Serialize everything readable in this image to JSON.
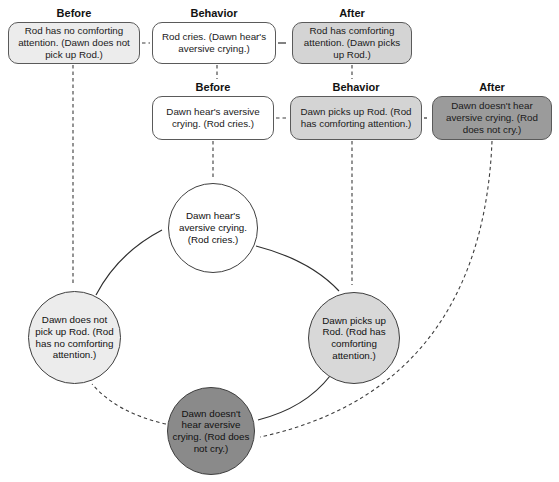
{
  "diagram_type": "behavior-contingency-cycle",
  "colors": {
    "background": "#ffffff",
    "box_white": "#ffffff",
    "box_light_gray": "#ececec",
    "box_medium_gray": "#d4d4d4",
    "box_dark_gray": "#9b9b9b",
    "circle_dark_gray": "#8a8a8a",
    "outline": "#5a5a5a",
    "arrow": "#2e2e2e"
  },
  "rows": [
    {
      "cells": [
        {
          "label": "Before",
          "text": "Rod has no comforting attention. (Dawn does not pick up Rod.)",
          "tone": "light"
        },
        {
          "label": "Behavior",
          "text": "Rod cries. (Dawn hear's aversive crying.)",
          "tone": "white"
        },
        {
          "label": "After",
          "text": "Rod has comforting attention. (Dawn picks up Rod.)",
          "tone": "mid"
        }
      ]
    },
    {
      "cells": [
        {
          "label": "Before",
          "text": "Dawn hear's aversive crying. (Rod cries.)",
          "tone": "white"
        },
        {
          "label": "Behavior",
          "text": "Dawn picks up Rod. (Rod has comforting attention.)",
          "tone": "mid"
        },
        {
          "label": "After",
          "text": "Dawn doesn't hear aversive crying. (Rod does not cry.)",
          "tone": "dark"
        }
      ]
    }
  ],
  "circles": [
    {
      "id": "aversive-crying",
      "text": "Dawn hear's aversive crying. (Rod cries.)",
      "tone": "white"
    },
    {
      "id": "no-pickup",
      "text": "Dawn does not pick up Rod. (Rod has no comforting attention.)",
      "tone": "light"
    },
    {
      "id": "pickup",
      "text": "Dawn picks up Rod. (Rod has comforting attention.)",
      "tone": "mid"
    },
    {
      "id": "no-crying",
      "text": "Dawn doesn't hear aversive crying. (Rod does not cry.)",
      "tone": "dark"
    }
  ],
  "connections": [
    {
      "from": "row1-before",
      "to": "row1-behavior",
      "style": "dashed"
    },
    {
      "from": "row1-behavior",
      "to": "row1-after",
      "style": "solid-arrow"
    },
    {
      "from": "row2-before",
      "to": "row2-behavior",
      "style": "dashed"
    },
    {
      "from": "row2-behavior",
      "to": "row2-after",
      "style": "solid-arrow"
    },
    {
      "from": "row1-before",
      "to": "circle-no-pickup",
      "style": "dashed-arrow"
    },
    {
      "from": "row1-behavior",
      "to": "row2-before",
      "style": "dashed"
    },
    {
      "from": "row1-after",
      "to": "row2-behavior",
      "style": "dashed"
    },
    {
      "from": "row2-before",
      "to": "circle-aversive-crying",
      "style": "dashed-arrow"
    },
    {
      "from": "row2-behavior",
      "to": "circle-pickup",
      "style": "dashed-arrow"
    },
    {
      "from": "row2-after",
      "to": "circle-no-crying",
      "style": "dashed-arrow"
    },
    {
      "from": "circle-no-pickup",
      "to": "circle-aversive-crying",
      "style": "solid-arrow"
    },
    {
      "from": "circle-aversive-crying",
      "to": "circle-pickup",
      "style": "solid-arrow"
    },
    {
      "from": "circle-pickup",
      "to": "circle-no-crying",
      "style": "solid-arrow"
    },
    {
      "from": "circle-no-crying",
      "to": "circle-no-pickup",
      "style": "dashed-arrow"
    }
  ]
}
